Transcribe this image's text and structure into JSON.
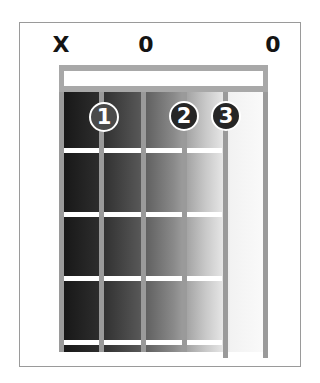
{
  "diagram": {
    "type": "guitar-chord-chart",
    "string_markers": [
      {
        "string": 6,
        "symbol": "X",
        "meaning": "muted"
      },
      {
        "string": 5,
        "symbol": "0",
        "meaning": "open"
      },
      {
        "string": 1,
        "symbol": "0",
        "meaning": "open"
      }
    ],
    "finger_dots": [
      {
        "label": "1",
        "string": 5,
        "fret": 1
      },
      {
        "label": "2",
        "string": 3,
        "fret": 1
      },
      {
        "label": "3",
        "string": 2,
        "fret": 1
      }
    ],
    "strings": 6,
    "frets_shown": 4,
    "colors": {
      "frame_border": "#9a9a9a",
      "string": "#9a9a9a",
      "fret": "#ffffff",
      "nut": "#ffffff",
      "dot_fill_1": "#4a4a4a",
      "dot_fill_2": "#262626",
      "dot_fill_3": "#262626",
      "marker_text": "#141414"
    }
  }
}
